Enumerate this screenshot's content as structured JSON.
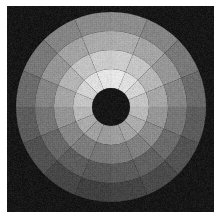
{
  "figure": {
    "title": "Polar sector intensity map",
    "width_px": 221,
    "height_px": 219,
    "background_color": "#ffffff",
    "plot_background_color": "#161616",
    "border_color": "#ffffff",
    "border_width_px": 7
  },
  "chart_data": {
    "type": "heatmap",
    "subtype": "polar-sector-grid",
    "title": "Polar sector intensity map",
    "subtitle": "",
    "xlabel": "",
    "ylabel": "",
    "legend": [],
    "grid": false,
    "colormap": "gray",
    "value_range": [
      0,
      255
    ],
    "center_px": [
      104,
      101
    ],
    "n_rings": 5,
    "n_sectors": 16,
    "sector_start_angle_deg": -90,
    "sector_width_deg": 22.5,
    "ring_radii_px": [
      19,
      38,
      57,
      76,
      95
    ],
    "inner_hole": {
      "radius_px": 19,
      "value": 22,
      "color": "#161616"
    },
    "outer_disc_radius_px": 95,
    "background_value": 22,
    "sector_angles_deg": [
      -90,
      -67.5,
      -45,
      -22.5,
      0,
      22.5,
      45,
      67.5,
      90,
      112.5,
      135,
      157.5,
      180,
      202.5,
      225,
      247.5
    ],
    "ring_labels": [
      "r1",
      "r2",
      "r3",
      "r4",
      "r5"
    ],
    "sector_labels": [
      "s1",
      "s2",
      "s3",
      "s4",
      "s5",
      "s6",
      "s7",
      "s8",
      "s9",
      "s10",
      "s11",
      "s12",
      "s13",
      "s14",
      "s15",
      "s16"
    ],
    "values": [
      [
        248,
        246,
        238,
        224,
        214,
        206,
        200,
        198,
        196,
        200,
        208,
        216,
        226,
        236,
        244,
        247
      ],
      [
        230,
        222,
        210,
        196,
        184,
        172,
        164,
        158,
        154,
        160,
        170,
        182,
        196,
        210,
        222,
        228
      ],
      [
        204,
        196,
        182,
        166,
        150,
        138,
        128,
        122,
        118,
        124,
        134,
        148,
        164,
        180,
        194,
        202
      ],
      [
        172,
        164,
        150,
        134,
        118,
        106,
        96,
        90,
        86,
        92,
        102,
        116,
        132,
        148,
        162,
        170
      ],
      [
        140,
        132,
        120,
        106,
        92,
        82,
        74,
        68,
        64,
        70,
        80,
        92,
        106,
        120,
        132,
        138
      ]
    ]
  }
}
